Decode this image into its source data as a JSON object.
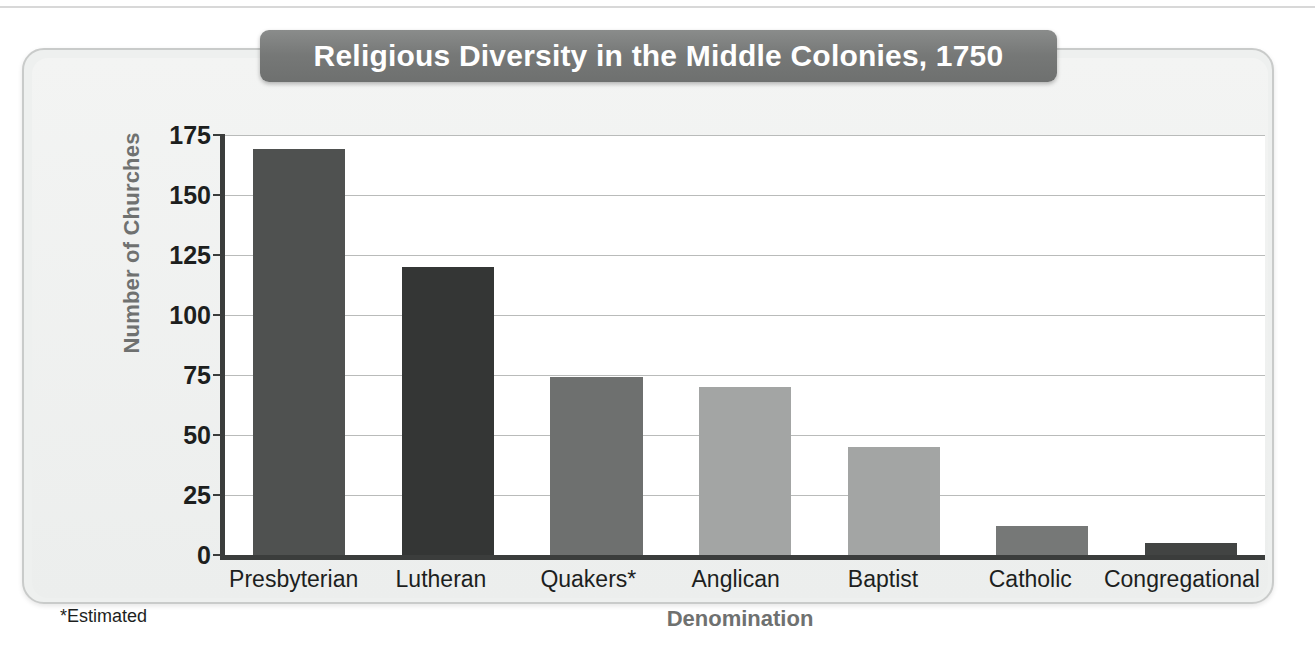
{
  "figure": {
    "footnote": "*Estimated",
    "panel_bg": "#eef0ef",
    "title_banner_color": "#767877",
    "axis_color": "#3b3d3c",
    "gridline_color": "#b9bbba",
    "axis_title_color": "#6f7170"
  },
  "chart_data": {
    "type": "bar",
    "title": "Religious Diversity in the Middle Colonies, 1750",
    "xlabel": "Denomination",
    "ylabel": "Number of Churches",
    "categories": [
      "Presbyterian",
      "Lutheran",
      "Quakers*",
      "Anglican",
      "Baptist",
      "Catholic",
      "Congregational"
    ],
    "values": [
      169,
      120,
      74,
      70,
      45,
      12,
      5
    ],
    "bar_colors": [
      "#4f5150",
      "#343635",
      "#6e706f",
      "#a3a5a4",
      "#a3a5a4",
      "#767877",
      "#424443"
    ],
    "ylim": [
      0,
      175
    ],
    "yticks": [
      0,
      25,
      50,
      75,
      100,
      125,
      150,
      175
    ],
    "ytick_labels": [
      "0",
      "25",
      "50",
      "75",
      "100",
      "125",
      "150",
      "175"
    ],
    "grid": true,
    "legend": "none",
    "annotations": [
      "*Estimated"
    ]
  }
}
